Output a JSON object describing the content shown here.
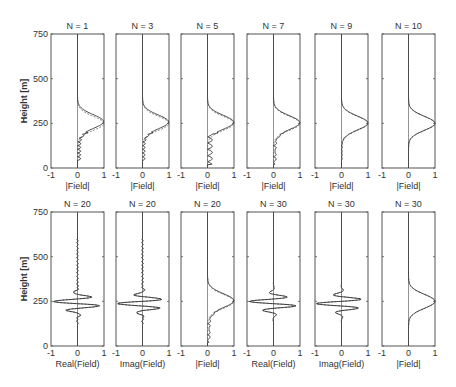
{
  "chart_data": {
    "type": "line",
    "layout": {
      "rows": 2,
      "cols": 6,
      "grid": false,
      "legend": "none"
    },
    "ylabel": "Height [m]",
    "ylim": [
      0,
      750
    ],
    "yticks": [
      0,
      250,
      500,
      750
    ],
    "xlim": [
      -1,
      1
    ],
    "xticks": [
      -1,
      0,
      1
    ],
    "line_styles": {
      "solid": "computed field",
      "dashed": "reference field"
    },
    "panels": [
      {
        "row": 0,
        "col": 0,
        "title": "N = 1",
        "xlabel": "|Field|",
        "kind": "abs",
        "quality": 0
      },
      {
        "row": 0,
        "col": 1,
        "title": "N = 3",
        "xlabel": "|Field|",
        "kind": "abs",
        "quality": 1
      },
      {
        "row": 0,
        "col": 2,
        "title": "N = 5",
        "xlabel": "|Field|",
        "kind": "abs",
        "quality": 2
      },
      {
        "row": 0,
        "col": 3,
        "title": "N = 7",
        "xlabel": "|Field|",
        "kind": "abs",
        "quality": 3
      },
      {
        "row": 0,
        "col": 4,
        "title": "N = 9",
        "xlabel": "|Field|",
        "kind": "abs",
        "quality": 4
      },
      {
        "row": 0,
        "col": 5,
        "title": "N = 10",
        "xlabel": "|Field|",
        "kind": "abs",
        "quality": 5
      },
      {
        "row": 1,
        "col": 0,
        "title": "N = 20",
        "xlabel": "Real(Field)",
        "kind": "real",
        "quality": 3
      },
      {
        "row": 1,
        "col": 1,
        "title": "N = 20",
        "xlabel": "Imag(Field)",
        "kind": "imag",
        "quality": 3
      },
      {
        "row": 1,
        "col": 2,
        "title": "N = 20",
        "xlabel": "|Field|",
        "kind": "abs",
        "quality": 3
      },
      {
        "row": 1,
        "col": 3,
        "title": "N = 30",
        "xlabel": "Real(Field)",
        "kind": "real",
        "quality": 5
      },
      {
        "row": 1,
        "col": 4,
        "title": "N = 30",
        "xlabel": "Imag(Field)",
        "kind": "imag",
        "quality": 5
      },
      {
        "row": 1,
        "col": 5,
        "title": "N = 30",
        "xlabel": "|Field|",
        "kind": "abs",
        "quality": 5
      }
    ],
    "reference_profile": {
      "abs": {
        "peak_height_m": 250,
        "peak_value": 1.0,
        "support_m": [
          130,
          370
        ]
      },
      "real": {
        "extrema": [
          [
            300,
            -0.4
          ],
          [
            270,
            0.7
          ],
          [
            250,
            -0.9
          ],
          [
            225,
            0.9
          ],
          [
            200,
            -0.6
          ],
          [
            170,
            0.3
          ]
        ]
      },
      "imag": {
        "extrema": [
          [
            310,
            -0.3
          ],
          [
            285,
            0.8
          ],
          [
            262,
            -0.9
          ],
          [
            240,
            0.9
          ],
          [
            210,
            -0.7
          ],
          [
            180,
            0.3
          ]
        ]
      }
    }
  }
}
